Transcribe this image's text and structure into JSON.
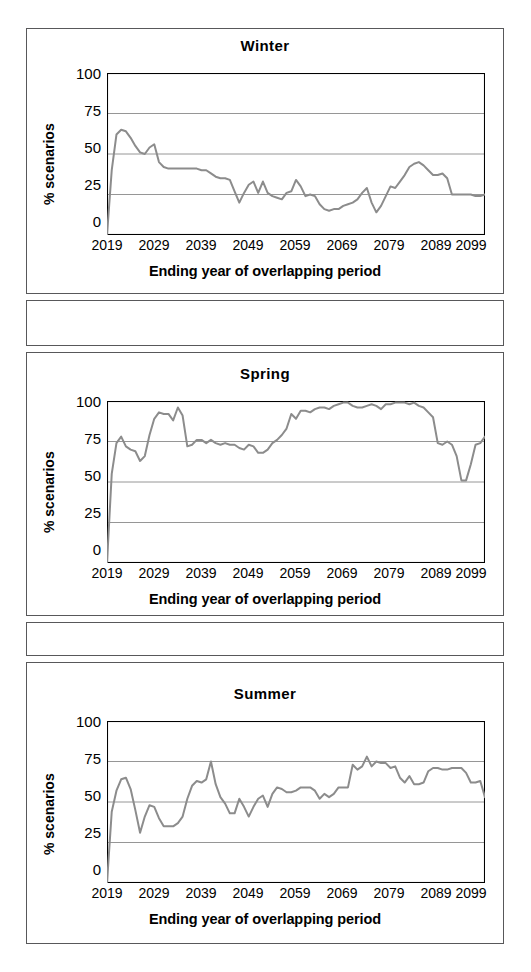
{
  "figure": {
    "panels": [
      "winter",
      "spring",
      "summer"
    ],
    "axis_color": "#000000",
    "grid_color": "#8a8a8a",
    "series_color": "#8c8c8c",
    "frame_color": "#58585a"
  },
  "labels": {
    "ylabel": "% scenarios",
    "xlabel": "Ending year of overlapping period",
    "yticks": [
      "100",
      "75",
      "50",
      "25",
      "0"
    ],
    "xticks": [
      "2019",
      "2029",
      "2039",
      "2049",
      "2059",
      "2069",
      "2079",
      "2089",
      "2099"
    ]
  },
  "titles": {
    "winter": "Winter",
    "spring": "Spring",
    "summer": "Summer"
  },
  "chart_data": [
    {
      "type": "line",
      "title": "Winter",
      "xlabel": "Ending year of overlapping period",
      "ylabel": "% scenarios",
      "xlim": [
        2019,
        2099
      ],
      "ylim": [
        0,
        100
      ],
      "yticks": [
        0,
        25,
        50,
        75,
        100
      ],
      "xticks": [
        2019,
        2029,
        2039,
        2049,
        2059,
        2069,
        2079,
        2089,
        2099
      ],
      "grid": "horizontal",
      "legend": "none",
      "x": [
        2019,
        2020,
        2021,
        2022,
        2023,
        2024,
        2025,
        2026,
        2027,
        2028,
        2029,
        2030,
        2031,
        2032,
        2033,
        2034,
        2035,
        2036,
        2037,
        2038,
        2039,
        2040,
        2041,
        2042,
        2043,
        2044,
        2045,
        2046,
        2047,
        2048,
        2049,
        2050,
        2051,
        2052,
        2053,
        2054,
        2055,
        2056,
        2057,
        2058,
        2059,
        2060,
        2061,
        2062,
        2063,
        2064,
        2065,
        2066,
        2067,
        2068,
        2069,
        2070,
        2071,
        2072,
        2073,
        2074,
        2075,
        2076,
        2077,
        2078,
        2079,
        2080,
        2081,
        2082,
        2083,
        2084,
        2085,
        2086,
        2087,
        2088,
        2089,
        2090,
        2091,
        2092,
        2093,
        2094,
        2095,
        2096,
        2097,
        2098,
        2099
      ],
      "values": [
        0,
        40,
        62,
        65,
        64,
        60,
        55,
        51,
        50,
        54,
        56,
        45,
        42,
        41,
        41,
        41,
        41,
        41,
        41,
        41,
        40,
        40,
        38,
        36,
        35,
        35,
        34,
        27,
        20,
        26,
        31,
        33,
        26,
        33,
        26,
        24,
        23,
        22,
        26,
        27,
        34,
        30,
        24,
        25,
        24,
        19,
        16,
        15,
        16,
        16,
        18,
        19,
        20,
        22,
        26,
        29,
        20,
        14,
        18,
        24,
        30,
        29,
        33,
        37,
        42,
        44,
        45,
        43,
        40,
        37,
        37,
        38,
        35,
        25,
        25,
        25,
        25,
        25,
        24,
        24,
        25,
        25,
        26,
        24,
        22,
        20,
        19
      ]
    },
    {
      "type": "line",
      "title": "Spring",
      "xlabel": "Ending year of overlapping period",
      "ylabel": "% scenarios",
      "xlim": [
        2019,
        2099
      ],
      "ylim": [
        0,
        100
      ],
      "yticks": [
        0,
        25,
        50,
        75,
        100
      ],
      "xticks": [
        2019,
        2029,
        2039,
        2049,
        2059,
        2069,
        2079,
        2089,
        2099
      ],
      "grid": "horizontal",
      "legend": "none",
      "x": [
        2019,
        2020,
        2021,
        2022,
        2023,
        2024,
        2025,
        2026,
        2027,
        2028,
        2029,
        2030,
        2031,
        2032,
        2033,
        2034,
        2035,
        2036,
        2037,
        2038,
        2039,
        2040,
        2041,
        2042,
        2043,
        2044,
        2045,
        2046,
        2047,
        2048,
        2049,
        2050,
        2051,
        2052,
        2053,
        2054,
        2055,
        2056,
        2057,
        2058,
        2059,
        2060,
        2061,
        2062,
        2063,
        2064,
        2065,
        2066,
        2067,
        2068,
        2069,
        2070,
        2071,
        2072,
        2073,
        2074,
        2075,
        2076,
        2077,
        2078,
        2079,
        2080,
        2081,
        2082,
        2083,
        2084,
        2085,
        2086,
        2087,
        2088,
        2089,
        2090,
        2091,
        2092,
        2093,
        2094,
        2095,
        2096,
        2097,
        2098,
        2099
      ],
      "values": [
        0,
        55,
        74,
        78,
        72,
        70,
        69,
        63,
        66,
        79,
        89,
        93,
        92,
        92,
        88,
        96,
        91,
        72,
        73,
        76,
        76,
        74,
        76,
        74,
        73,
        74,
        73,
        73,
        71,
        70,
        73,
        72,
        68,
        68,
        70,
        74,
        76,
        79,
        83,
        92,
        89,
        94,
        94,
        93,
        95,
        96,
        96,
        95,
        97,
        98,
        99,
        99,
        97,
        96,
        96,
        97,
        98,
        97,
        95,
        98,
        98,
        99,
        99,
        99,
        98,
        99,
        97,
        96,
        93,
        90,
        74,
        73,
        75,
        73,
        66,
        51,
        51,
        61,
        73,
        74,
        78,
        85,
        88,
        90,
        92,
        93
      ]
    },
    {
      "type": "line",
      "title": "Summer",
      "xlabel": "Ending year of overlapping period",
      "ylabel": "% scenarios",
      "xlim": [
        2019,
        2099
      ],
      "ylim": [
        0,
        100
      ],
      "yticks": [
        0,
        25,
        50,
        75,
        100
      ],
      "xticks": [
        2019,
        2029,
        2039,
        2049,
        2059,
        2069,
        2079,
        2089,
        2099
      ],
      "grid": "horizontal",
      "legend": "none",
      "x": [
        2019,
        2020,
        2021,
        2022,
        2023,
        2024,
        2025,
        2026,
        2027,
        2028,
        2029,
        2030,
        2031,
        2032,
        2033,
        2034,
        2035,
        2036,
        2037,
        2038,
        2039,
        2040,
        2041,
        2042,
        2043,
        2044,
        2045,
        2046,
        2047,
        2048,
        2049,
        2050,
        2051,
        2052,
        2053,
        2054,
        2055,
        2056,
        2057,
        2058,
        2059,
        2060,
        2061,
        2062,
        2063,
        2064,
        2065,
        2066,
        2067,
        2068,
        2069,
        2070,
        2071,
        2072,
        2073,
        2074,
        2075,
        2076,
        2077,
        2078,
        2079,
        2080,
        2081,
        2082,
        2083,
        2084,
        2085,
        2086,
        2087,
        2088,
        2089,
        2090,
        2091,
        2092,
        2093,
        2094,
        2095,
        2096,
        2097,
        2098,
        2099
      ],
      "values": [
        0,
        44,
        57,
        64,
        65,
        58,
        45,
        31,
        41,
        48,
        47,
        40,
        35,
        35,
        35,
        37,
        41,
        52,
        60,
        63,
        62,
        64,
        75,
        61,
        53,
        49,
        43,
        43,
        52,
        47,
        41,
        47,
        52,
        54,
        47,
        55,
        59,
        58,
        56,
        56,
        57,
        59,
        59,
        59,
        57,
        52,
        55,
        53,
        55,
        59,
        59,
        59,
        73,
        70,
        72,
        78,
        72,
        75,
        74,
        74,
        71,
        72,
        65,
        62,
        66,
        61,
        61,
        62,
        69,
        71,
        71,
        70,
        70,
        71,
        71,
        71,
        68,
        62,
        62,
        63,
        53
      ]
    }
  ]
}
